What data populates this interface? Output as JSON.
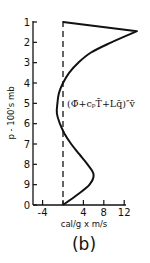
{
  "chart_data": {
    "type": "line",
    "title": "",
    "panel_label": "(b)",
    "xlabel": "cal/g x m/s",
    "ylabel": "p - 100's mb",
    "annotation": "(Φ̄+cₚT̄+Lq̄)″v̄",
    "xlim": [
      -6,
      14
    ],
    "ylim": [
      10,
      1
    ],
    "x_ticks": [
      -4,
      0,
      4,
      8,
      12
    ],
    "x_tick_labels": [
      "-4",
      "",
      "4",
      "8",
      "12"
    ],
    "y_ticks": [
      1,
      2,
      3,
      4,
      5,
      6,
      7,
      8,
      9,
      10
    ],
    "y_tick_labels": [
      "1",
      "2",
      "3",
      "4",
      "5",
      "6",
      "7",
      "8",
      "9",
      "0"
    ],
    "reference_line": {
      "x": 0,
      "style": "dashed"
    },
    "grid": false,
    "series": [
      {
        "name": "(Φ̄+cₚT̄+Lq̄)″v̄",
        "points": [
          {
            "p": 1.0,
            "value": 0.0
          },
          {
            "p": 1.45,
            "value": 14.5
          },
          {
            "p": 2.0,
            "value": 9.5
          },
          {
            "p": 2.5,
            "value": 5.5
          },
          {
            "p": 3.0,
            "value": 3.0
          },
          {
            "p": 3.5,
            "value": 1.2
          },
          {
            "p": 4.0,
            "value": 0.0
          },
          {
            "p": 4.5,
            "value": -0.8
          },
          {
            "p": 5.0,
            "value": -1.1
          },
          {
            "p": 5.5,
            "value": -1.2
          },
          {
            "p": 6.0,
            "value": -0.6
          },
          {
            "p": 6.5,
            "value": 0.3
          },
          {
            "p": 7.0,
            "value": 1.6
          },
          {
            "p": 7.5,
            "value": 3.2
          },
          {
            "p": 8.0,
            "value": 4.8
          },
          {
            "p": 8.5,
            "value": 6.0
          },
          {
            "p": 9.0,
            "value": 5.2
          },
          {
            "p": 9.5,
            "value": 2.8
          },
          {
            "p": 10.0,
            "value": 0.0
          }
        ]
      }
    ]
  }
}
